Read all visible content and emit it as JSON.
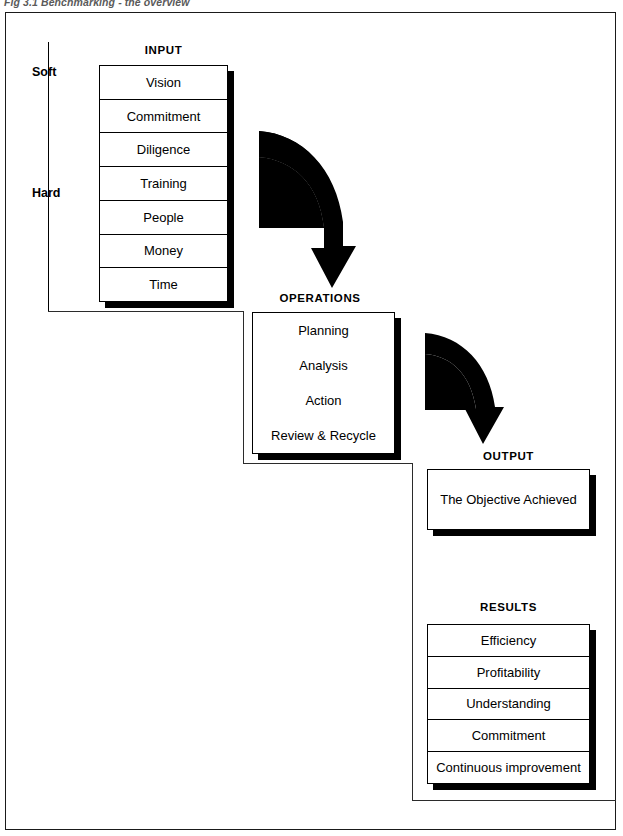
{
  "figure": {
    "caption": "Fig 3.1 Benchmarking - the overview",
    "accent_color": "#000000",
    "background_color": "#ffffff"
  },
  "scale": {
    "top_label": "Soft",
    "bottom_label": "Hard"
  },
  "sections": {
    "input": {
      "heading": "INPUT",
      "items": [
        "Vision",
        "Commitment",
        "Diligence",
        "Training",
        "People",
        "Money",
        "Time"
      ]
    },
    "operations": {
      "heading": "OPERATIONS",
      "items": [
        "Planning",
        "Analysis",
        "Action",
        "Review & Recycle"
      ]
    },
    "output": {
      "heading": "OUTPUT",
      "items": [
        "The Objective Achieved"
      ]
    },
    "results": {
      "heading": "RESULTS",
      "items": [
        "Efficiency",
        "Profitability",
        "Understanding",
        "Commitment",
        "Continuous improvement"
      ]
    }
  },
  "arrows": [
    {
      "name": "input-to-operations"
    },
    {
      "name": "operations-to-output"
    }
  ]
}
